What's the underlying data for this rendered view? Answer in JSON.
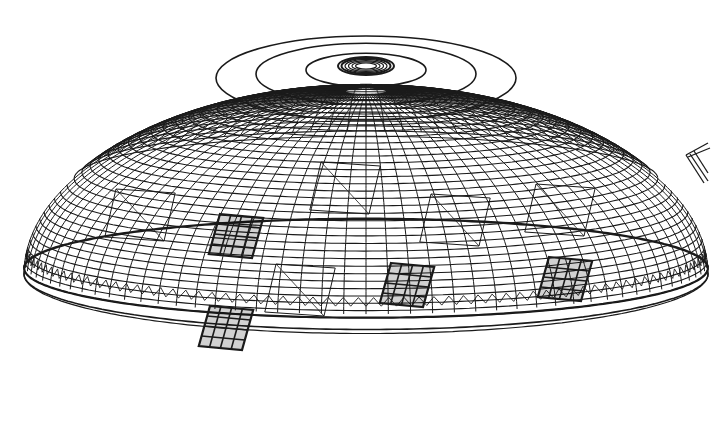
{
  "figure": {
    "subject": "lattice dome structure wireframe",
    "view": "perspective elevation",
    "colors": {
      "background": "#ffffff",
      "line": "#1a1a1a"
    },
    "dome": {
      "center_x": 366,
      "crown_y": 60,
      "base_y": 292,
      "radius_x": 342,
      "radius_y": 90,
      "meridians": 96,
      "parallels": 34,
      "apex_ring": {
        "cx": 366,
        "cy": 66,
        "rx": 28,
        "ry": 9
      }
    },
    "openings": [
      {
        "name": "skylight-left",
        "cx": 236,
        "cy": 236,
        "filled": true
      },
      {
        "name": "skylight-center",
        "cx": 407,
        "cy": 285,
        "filled": true
      },
      {
        "name": "skylight-right",
        "cx": 565,
        "cy": 279,
        "filled": true
      },
      {
        "name": "skylight-lower-left",
        "cx": 226,
        "cy": 328,
        "filled": true
      },
      {
        "name": "frame-upper-center",
        "cx": 345,
        "cy": 188,
        "filled": false
      },
      {
        "name": "frame-left",
        "cx": 140,
        "cy": 215,
        "filled": false
      },
      {
        "name": "frame-right",
        "cx": 455,
        "cy": 220,
        "filled": false
      },
      {
        "name": "frame-far-right",
        "cx": 560,
        "cy": 210,
        "filled": false
      },
      {
        "name": "frame-lower-center",
        "cx": 300,
        "cy": 290,
        "filled": false
      }
    ],
    "fragment": {
      "name": "partial-detail-right-edge",
      "x": 686,
      "y": 145
    }
  }
}
